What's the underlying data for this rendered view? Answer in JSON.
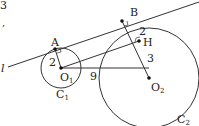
{
  "labels": {
    "line": "l",
    "A": "A",
    "B": "B",
    "H": "H",
    "O1": "O",
    "O1_sub": "1",
    "O2": "O",
    "O2_sub": "2",
    "C1": "C",
    "C1_sub": "1",
    "C2": "C",
    "C2_sub": "2",
    "r1": "2",
    "BH": "2",
    "HO2": "3",
    "O1O2": "9",
    "top_fragment": "3",
    "fragment2": ","
  }
}
